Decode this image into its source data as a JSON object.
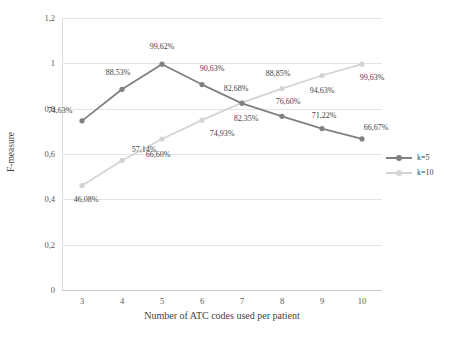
{
  "chart_data": {
    "type": "line",
    "title": "",
    "xlabel": "Number of ATC codes used per patient",
    "ylabel": "F-measure",
    "x": [
      3,
      4,
      5,
      6,
      7,
      8,
      9,
      10
    ],
    "xtick_labels": [
      "3",
      "4",
      "5",
      "6",
      "7",
      "8",
      "9",
      "10"
    ],
    "ytick_labels": [
      "0",
      "0,2",
      "0,4",
      "0,6",
      "0,8",
      "1",
      "1,2"
    ],
    "ytick_values": [
      0,
      0.2,
      0.4,
      0.6,
      0.8,
      1.0,
      1.2
    ],
    "ylim": [
      0,
      1.2
    ],
    "grid": true,
    "legend_position": "right",
    "series": [
      {
        "name": "k=5",
        "color": "#808080",
        "marker": "circle",
        "values": [
          0.7463,
          0.8853,
          0.9962,
          0.9063,
          0.8235,
          0.766,
          0.7122,
          0.6667
        ],
        "labels": [
          "74,63%",
          "88,53%",
          "99,62%",
          "90,63%",
          "82,35%",
          "76,60%",
          "71,22%",
          "66,67%"
        ]
      },
      {
        "name": "k=10",
        "color": "#d4d4d4",
        "marker": "circle",
        "values": [
          0.4608,
          0.5714,
          0.666,
          0.7493,
          0.8268,
          0.8885,
          0.9463,
          0.9963
        ],
        "labels": [
          "46,08%",
          "57,14%",
          "66,60%",
          "74,93%",
          "82,68%",
          "88,85%",
          "94,63%",
          "99,63%"
        ]
      }
    ]
  },
  "legend": {
    "items": [
      {
        "label": "k=5"
      },
      {
        "label": "k=10"
      }
    ]
  },
  "colors": {
    "series_k5": "#808080",
    "series_k10": "#d4d4d4",
    "gridline": "#e3e3e3",
    "tick_text": "#595959",
    "axis_text": "#3f3f3f"
  }
}
